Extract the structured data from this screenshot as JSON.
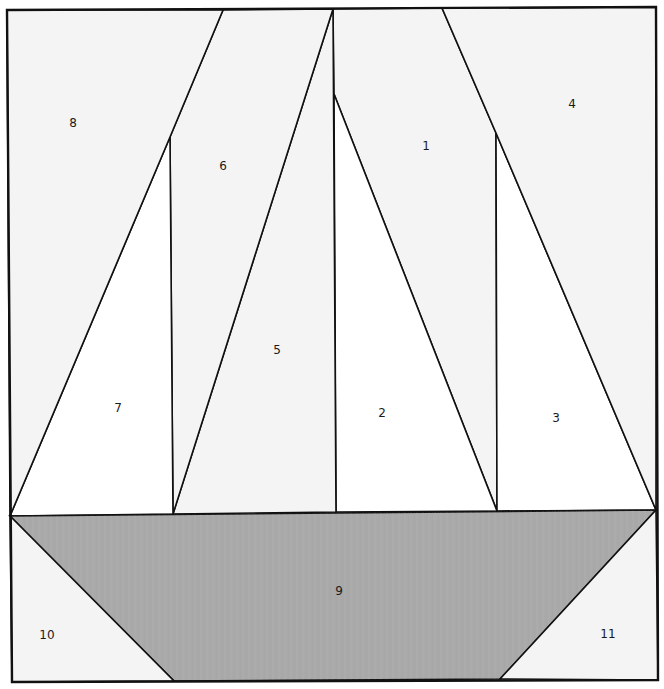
{
  "diagram": {
    "width": 664,
    "height": 689,
    "colors": {
      "background_fabric": "#f4f4f4",
      "sail_fabric": "#ffffff",
      "boat_fabric": "#a9a9a9",
      "outline": "#111111",
      "label": "#1a1a1a"
    },
    "frame": [
      [
        7,
        10
      ],
      [
        656,
        7
      ],
      [
        658,
        680
      ],
      [
        12,
        682
      ]
    ],
    "pieces": [
      {
        "id": "1",
        "label": "1",
        "fill": "background_fabric",
        "points": [
          [
            333,
            9
          ],
          [
            442,
            8
          ],
          [
            496,
            133
          ],
          [
            497,
            511
          ],
          [
            334,
            94
          ]
        ],
        "label_pos": [
          426,
          146
        ]
      },
      {
        "id": "2",
        "label": "2",
        "fill": "sail_fabric",
        "points": [
          [
            334,
            94
          ],
          [
            497,
            511
          ],
          [
            336,
            512
          ]
        ],
        "label_pos": [
          382,
          413
        ]
      },
      {
        "id": "3",
        "label": "3",
        "fill": "sail_fabric",
        "points": [
          [
            496,
            133
          ],
          [
            656,
            510
          ],
          [
            497,
            511
          ]
        ],
        "label_pos": [
          556,
          418
        ]
      },
      {
        "id": "4",
        "label": "4",
        "fill": "background_fabric",
        "points": [
          [
            442,
            8
          ],
          [
            656,
            7
          ],
          [
            656,
            510
          ],
          [
            496,
            133
          ]
        ],
        "label_pos": [
          572,
          104
        ]
      },
      {
        "id": "5",
        "label": "5",
        "fill": "background_fabric",
        "points": [
          [
            333,
            9
          ],
          [
            336,
            512
          ],
          [
            173,
            514
          ]
        ],
        "label_pos": [
          277,
          350
        ]
      },
      {
        "id": "6",
        "label": "6",
        "fill": "background_fabric",
        "points": [
          [
            223,
            10
          ],
          [
            333,
            9
          ],
          [
            173,
            514
          ],
          [
            170,
            137
          ]
        ],
        "label_pos": [
          223,
          166
        ]
      },
      {
        "id": "7",
        "label": "7",
        "fill": "sail_fabric",
        "points": [
          [
            170,
            137
          ],
          [
            173,
            514
          ],
          [
            10,
            516
          ]
        ],
        "label_pos": [
          118,
          408
        ]
      },
      {
        "id": "8",
        "label": "8",
        "fill": "background_fabric",
        "points": [
          [
            7,
            10
          ],
          [
            223,
            10
          ],
          [
            170,
            137
          ],
          [
            10,
            516
          ]
        ],
        "label_pos": [
          73,
          123
        ]
      },
      {
        "id": "9",
        "label": "9",
        "fill": "boat_fabric",
        "points": [
          [
            10,
            516
          ],
          [
            656,
            510
          ],
          [
            500,
            679
          ],
          [
            174,
            681
          ]
        ],
        "label_pos": [
          339,
          591
        ]
      },
      {
        "id": "10",
        "label": "10",
        "fill": "background_fabric",
        "points": [
          [
            10,
            516
          ],
          [
            174,
            681
          ],
          [
            12,
            682
          ]
        ],
        "label_pos": [
          47,
          635
        ]
      },
      {
        "id": "11",
        "label": "11",
        "fill": "background_fabric",
        "points": [
          [
            656,
            510
          ],
          [
            658,
            680
          ],
          [
            500,
            679
          ]
        ],
        "label_pos": [
          608,
          634
        ]
      }
    ]
  }
}
